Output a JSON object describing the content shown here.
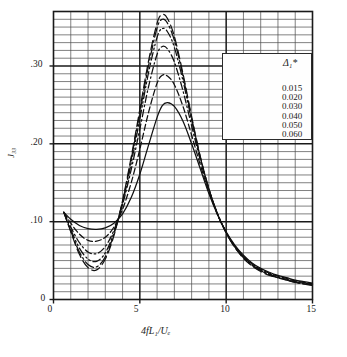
{
  "chart_data": {
    "type": "line",
    "title": "",
    "xlabel": "4fL₁/Uₑ",
    "ylabel": "J₃₃",
    "xlim": [
      0,
      15
    ],
    "ylim": [
      0,
      0.37
    ],
    "grid": true,
    "grid_minor_y": 0.01,
    "grid_major_y": 0.1,
    "grid_major_x": 5,
    "grid_minor_x": 1,
    "xticks": [
      0,
      5,
      10,
      15
    ],
    "xticklabels": [
      "0",
      "5",
      "10",
      "15"
    ],
    "yticks": [
      0,
      0.1,
      0.2,
      0.3
    ],
    "yticklabels": [
      "0",
      ".10",
      ".20",
      ".30"
    ],
    "legend_title": "Δ₁*",
    "legend_position": "upper right",
    "series": [
      {
        "name": "0.015",
        "style": "solid",
        "x": [
          0.6,
          1.0,
          1.5,
          2.0,
          2.5,
          3.0,
          3.5,
          4.0,
          4.5,
          5.0,
          5.5,
          6.0,
          6.3,
          6.6,
          7.0,
          7.5,
          8.0,
          8.5,
          9.0,
          9.5,
          10.0,
          10.5,
          11.0,
          11.5,
          12.0,
          12.5,
          13.0,
          13.5,
          14.0,
          14.5,
          15.0
        ],
        "y": [
          0.112,
          0.103,
          0.095,
          0.091,
          0.09,
          0.092,
          0.098,
          0.11,
          0.131,
          0.161,
          0.198,
          0.234,
          0.249,
          0.253,
          0.248,
          0.229,
          0.2,
          0.168,
          0.136,
          0.109,
          0.087,
          0.07,
          0.057,
          0.047,
          0.04,
          0.035,
          0.031,
          0.028,
          0.025,
          0.023,
          0.021
        ]
      },
      {
        "name": "0.020",
        "style": "dashed",
        "x": [
          0.6,
          1.0,
          1.5,
          2.0,
          2.5,
          3.0,
          3.5,
          4.0,
          4.5,
          5.0,
          5.5,
          6.0,
          6.3,
          6.6,
          7.0,
          7.5,
          8.0,
          8.5,
          9.0,
          9.5,
          10.0,
          10.5,
          11.0,
          11.5,
          12.0,
          12.5,
          13.0,
          13.5,
          14.0,
          14.5,
          15.0
        ],
        "y": [
          0.112,
          0.098,
          0.084,
          0.076,
          0.075,
          0.08,
          0.093,
          0.116,
          0.15,
          0.193,
          0.24,
          0.278,
          0.288,
          0.287,
          0.276,
          0.248,
          0.211,
          0.173,
          0.138,
          0.109,
          0.086,
          0.069,
          0.056,
          0.046,
          0.039,
          0.034,
          0.03,
          0.027,
          0.024,
          0.022,
          0.02
        ]
      },
      {
        "name": "0.030",
        "style": "dashdot",
        "x": [
          0.6,
          1.0,
          1.5,
          2.0,
          2.5,
          3.0,
          3.5,
          4.0,
          4.5,
          5.0,
          5.5,
          6.0,
          6.3,
          6.6,
          7.0,
          7.5,
          8.0,
          8.5,
          9.0,
          9.5,
          10.0,
          10.5,
          11.0,
          11.5,
          12.0,
          12.5,
          13.0,
          13.5,
          14.0,
          14.5,
          15.0
        ],
        "y": [
          0.112,
          0.093,
          0.073,
          0.061,
          0.059,
          0.068,
          0.089,
          0.122,
          0.167,
          0.219,
          0.273,
          0.315,
          0.325,
          0.322,
          0.305,
          0.268,
          0.223,
          0.179,
          0.141,
          0.11,
          0.086,
          0.068,
          0.055,
          0.045,
          0.038,
          0.033,
          0.029,
          0.026,
          0.023,
          0.021,
          0.02
        ]
      },
      {
        "name": "0.040",
        "style": "dashdotdot",
        "x": [
          0.6,
          1.0,
          1.5,
          2.0,
          2.5,
          3.0,
          3.5,
          4.0,
          4.5,
          5.0,
          5.5,
          6.0,
          6.3,
          6.6,
          7.0,
          7.5,
          8.0,
          8.5,
          9.0,
          9.5,
          10.0,
          10.5,
          11.0,
          11.5,
          12.0,
          12.5,
          13.0,
          13.5,
          14.0,
          14.5,
          15.0
        ],
        "y": [
          0.112,
          0.09,
          0.066,
          0.052,
          0.049,
          0.06,
          0.086,
          0.124,
          0.175,
          0.232,
          0.291,
          0.337,
          0.348,
          0.344,
          0.324,
          0.281,
          0.23,
          0.182,
          0.142,
          0.11,
          0.086,
          0.068,
          0.054,
          0.044,
          0.037,
          0.032,
          0.028,
          0.025,
          0.023,
          0.021,
          0.019
        ]
      },
      {
        "name": "0.050",
        "style": "longdashdot",
        "x": [
          0.6,
          1.0,
          1.5,
          2.0,
          2.5,
          3.0,
          3.5,
          4.0,
          4.5,
          5.0,
          5.5,
          6.0,
          6.3,
          6.6,
          7.0,
          7.5,
          8.0,
          8.5,
          9.0,
          9.5,
          10.0,
          10.5,
          11.0,
          11.5,
          12.0,
          12.5,
          13.0,
          13.5,
          14.0,
          14.5,
          15.0
        ],
        "y": [
          0.112,
          0.088,
          0.061,
          0.045,
          0.042,
          0.055,
          0.084,
          0.126,
          0.18,
          0.24,
          0.3,
          0.349,
          0.36,
          0.355,
          0.333,
          0.287,
          0.233,
          0.183,
          0.142,
          0.11,
          0.086,
          0.067,
          0.054,
          0.044,
          0.037,
          0.032,
          0.028,
          0.025,
          0.022,
          0.02,
          0.019
        ]
      },
      {
        "name": "0.060",
        "style": "longdash",
        "x": [
          0.6,
          1.0,
          1.5,
          2.0,
          2.5,
          3.0,
          3.5,
          4.0,
          4.5,
          5.0,
          5.5,
          6.0,
          6.3,
          6.6,
          7.0,
          7.5,
          8.0,
          8.5,
          9.0,
          9.5,
          10.0,
          10.5,
          11.0,
          11.5,
          12.0,
          12.5,
          13.0,
          13.5,
          14.0,
          14.5,
          15.0
        ],
        "y": [
          0.112,
          0.087,
          0.058,
          0.041,
          0.038,
          0.052,
          0.082,
          0.127,
          0.183,
          0.244,
          0.306,
          0.355,
          0.366,
          0.361,
          0.338,
          0.29,
          0.235,
          0.184,
          0.142,
          0.11,
          0.086,
          0.067,
          0.053,
          0.043,
          0.036,
          0.031,
          0.028,
          0.025,
          0.022,
          0.02,
          0.018
        ]
      }
    ]
  },
  "axis": {
    "ylabel": "J₃₃",
    "xlabel": "4fL₁/Uₑ",
    "xticklabels": [
      "0",
      "5",
      "10",
      "15"
    ],
    "yticklabels": [
      "0",
      ".10",
      ".20",
      ".30"
    ]
  },
  "legend": {
    "title": "Δ₁*",
    "entries": [
      {
        "label": "0.015",
        "style": "solid"
      },
      {
        "label": "0.020",
        "style": "dashed"
      },
      {
        "label": "0.030",
        "style": "dashdot"
      },
      {
        "label": "0.040",
        "style": "dashdotdot"
      },
      {
        "label": "0.050",
        "style": "longdashdot"
      },
      {
        "label": "0.060",
        "style": "longdash"
      }
    ]
  },
  "caption": {
    "text": ""
  },
  "colors": {
    "ink": "#1a1a1a",
    "grid": "#3a3a3a",
    "background": "#ffffff"
  }
}
